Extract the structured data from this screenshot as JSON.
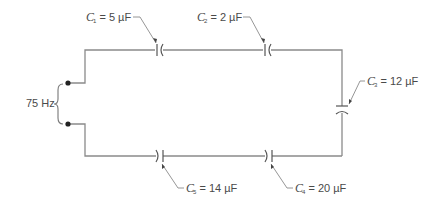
{
  "diagram": {
    "type": "series capacitor circuit",
    "source": {
      "label": "75 Hz"
    },
    "capacitors": [
      {
        "id": "C1",
        "symbol": "C",
        "subscript": "1",
        "value": "= 5 µF",
        "position": "top-left"
      },
      {
        "id": "C2",
        "symbol": "C",
        "subscript": "2",
        "value": "= 2 µF",
        "position": "top-right"
      },
      {
        "id": "C3",
        "symbol": "C",
        "subscript": "3",
        "value": "= 12 µF",
        "position": "right"
      },
      {
        "id": "C4",
        "symbol": "C",
        "subscript": "4",
        "value": "= 20 µF",
        "position": "bottom-right"
      },
      {
        "id": "C5",
        "symbol": "C",
        "subscript": "5",
        "value": "= 14 µF",
        "position": "bottom-left"
      }
    ],
    "colors": {
      "wire": "#8a8a8a",
      "text": "#4a4a4a",
      "terminal": "#222222"
    }
  }
}
